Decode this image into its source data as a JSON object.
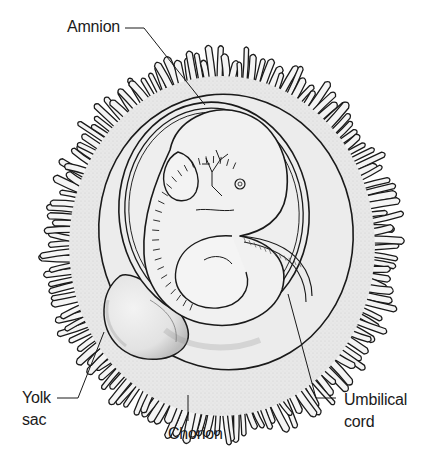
{
  "figure": {
    "colors": {
      "background": "#ffffff",
      "ink": "#1a1a1a",
      "chorion_fill": "#e6e6e6",
      "cavity_fill": "#ededed",
      "embryo_fill": "#f1f1f1",
      "shade": "#9a9a9a"
    }
  },
  "labels": {
    "amnion": {
      "text": "Amnion"
    },
    "yolk_sac": {
      "line1": "Yolk",
      "line2": "sac"
    },
    "umbilical_cord": {
      "line1": "Umbilical",
      "line2": "cord"
    },
    "chorion": {
      "text": "Chorion"
    }
  }
}
